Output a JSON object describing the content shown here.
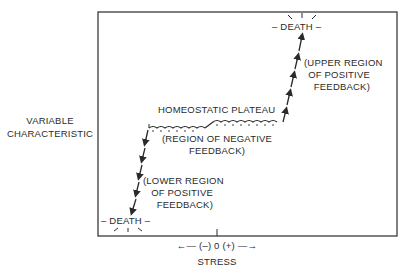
{
  "diagram": {
    "type": "homeostasis-stress-response",
    "y_axis_label": [
      "VARIABLE",
      "CHARACTERISTIC"
    ],
    "x_axis_label": "STRESS",
    "x_axis_scale": "←— (–) 0 (+) —→",
    "labels": {
      "death_upper": "– DEATH –",
      "death_lower": "– DEATH –",
      "plateau": "HOMEOSTATIC PLATEAU",
      "negative_feedback": [
        "(REGION OF NEGATIVE",
        "FEEDBACK)"
      ],
      "upper_positive": [
        "(UPPER REGION",
        "OF POSITIVE",
        "FEEDBACK)"
      ],
      "lower_positive": [
        "(LOWER REGION",
        "OF POSITIVE",
        "FEEDBACK)"
      ]
    },
    "colors": {
      "ink": "#2a2a2a",
      "background": "#ffffff"
    }
  }
}
